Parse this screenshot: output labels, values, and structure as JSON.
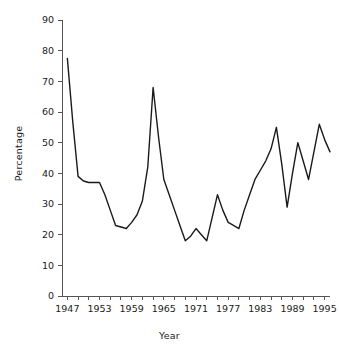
{
  "chart_data": {
    "type": "line",
    "title": "",
    "xlabel": "Year",
    "ylabel": "Percentage",
    "xlim": [
      1946,
      1996
    ],
    "ylim": [
      0,
      90
    ],
    "grid": false,
    "legend": null,
    "line_color": "#1a1a1a",
    "y_ticks": [
      0,
      10,
      20,
      30,
      40,
      50,
      60,
      70,
      80,
      90
    ],
    "y_tick_labels": [
      "0",
      "10",
      "20",
      "30",
      "40",
      "50",
      "60",
      "70",
      "80",
      "90"
    ],
    "x_ticks": [
      1947,
      1949,
      1951,
      1953,
      1955,
      1957,
      1959,
      1961,
      1963,
      1965,
      1967,
      1969,
      1971,
      1973,
      1975,
      1977,
      1979,
      1981,
      1983,
      1985,
      1987,
      1989,
      1991,
      1993,
      1995
    ],
    "x_tick_labels": [
      "1947",
      "",
      "",
      "1953",
      "",
      "",
      "1959",
      "",
      "",
      "1965",
      "",
      "",
      "1971",
      "",
      "",
      "1977",
      "",
      "",
      "1983",
      "",
      "",
      "1989",
      "",
      "",
      "1995"
    ],
    "x": [
      1947,
      1948,
      1949,
      1950,
      1951,
      1952,
      1953,
      1954,
      1955,
      1956,
      1957,
      1958,
      1959,
      1960,
      1961,
      1962,
      1963,
      1964,
      1965,
      1966,
      1967,
      1968,
      1969,
      1970,
      1971,
      1972,
      1973,
      1974,
      1975,
      1976,
      1977,
      1978,
      1979,
      1980,
      1981,
      1982,
      1983,
      1984,
      1985,
      1986,
      1987,
      1988,
      1989,
      1990,
      1991,
      1992,
      1993,
      1994,
      1995,
      1996
    ],
    "values": [
      77.5,
      57.0,
      39.0,
      37.5,
      37.0,
      37.0,
      37.0,
      33.0,
      28.0,
      23.0,
      22.5,
      22.0,
      24.0,
      26.5,
      31.0,
      42.0,
      68.0,
      52.0,
      38.0,
      33.0,
      28.0,
      23.0,
      18.0,
      19.5,
      22.0,
      20.0,
      18.0,
      25.5,
      33.0,
      28.0,
      24.0,
      23.0,
      22.0,
      28.0,
      33.0,
      38.0,
      41.0,
      44.0,
      48.0,
      55.0,
      43.0,
      29.0,
      40.0,
      50.0,
      44.0,
      38.0,
      47.0,
      56.0,
      51.0,
      47.0
    ]
  }
}
